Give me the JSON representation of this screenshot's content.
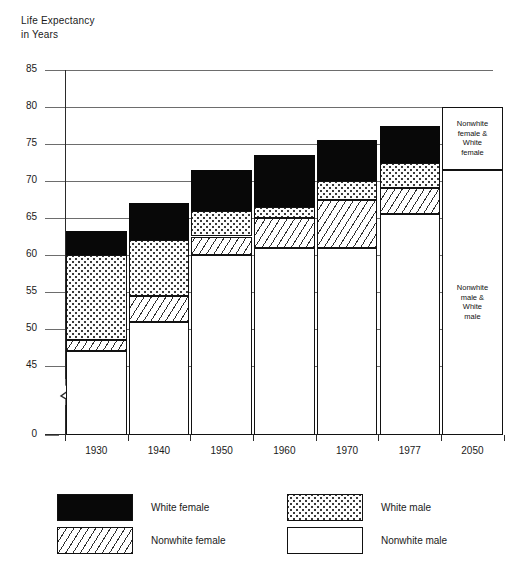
{
  "chart_data": {
    "type": "bar",
    "title": "",
    "ylabel": "Life Expectancy\nin Years",
    "xlabel": "",
    "ylim": [
      0,
      85
    ],
    "yticks": [
      0,
      45,
      50,
      55,
      60,
      65,
      70,
      75,
      80,
      85
    ],
    "ytick_labels": [
      "0",
      "45",
      "50",
      "55",
      "60",
      "65",
      "70",
      "75",
      "80",
      "85"
    ],
    "axis_break": true,
    "axis_break_between": [
      0,
      45
    ],
    "grid": true,
    "legend_position": "bottom",
    "categories": [
      "1930",
      "1940",
      "1950",
      "1960",
      "1970",
      "1977",
      "2050"
    ],
    "stack_order_bottom_to_top": [
      "Nonwhite male",
      "Nonwhite female",
      "White male",
      "White female"
    ],
    "series": [
      {
        "name": "Nonwhite male",
        "key": "nwm",
        "values": [
          47.0,
          51.0,
          60.0,
          61.0,
          61.0,
          65.5,
          71.5
        ]
      },
      {
        "name": "Nonwhite female",
        "key": "nwf",
        "values": [
          48.5,
          54.5,
          62.5,
          65.0,
          67.5,
          69.0,
          null
        ]
      },
      {
        "name": "White male",
        "key": "wm",
        "values": [
          60.0,
          62.0,
          66.0,
          66.5,
          70.0,
          72.5,
          null
        ]
      },
      {
        "name": "White female",
        "key": "wf",
        "values": [
          63.3,
          67.0,
          71.5,
          73.5,
          75.5,
          77.5,
          80.0
        ]
      }
    ],
    "bar_tops": [
      63.3,
      67.0,
      71.5,
      73.5,
      75.5,
      77.5,
      80.0
    ],
    "projection_bar": {
      "category": "2050",
      "top": 80.0,
      "split": 71.5,
      "upper_label": "Nonwhite\nfemale &\nWhite\nfemale",
      "lower_label": "Nonwhite\nmale &\nWhite\nmale"
    },
    "legend": [
      {
        "label": "White female",
        "key": "wf",
        "pattern": "solid-black"
      },
      {
        "label": "White male",
        "key": "wm",
        "pattern": "dotted"
      },
      {
        "label": "Nonwhite female",
        "key": "nwf",
        "pattern": "diagonal-hatch"
      },
      {
        "label": "Nonwhite male",
        "key": "nwm",
        "pattern": "white"
      }
    ],
    "colors": {
      "white_female": "#080808",
      "white_male": "#fdfdfd",
      "nonwhite_female": "#ffffff",
      "nonwhite_male": "#ffffff",
      "axis": "#2b2b2b",
      "grid": "#6d6d6d"
    }
  }
}
